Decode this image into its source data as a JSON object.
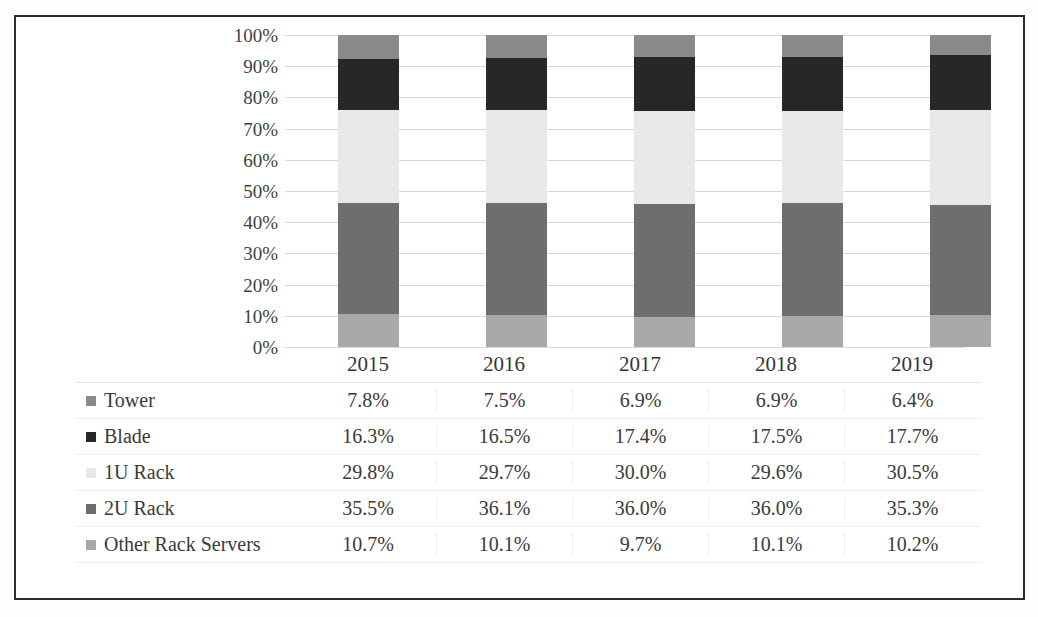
{
  "chart_data": {
    "type": "bar",
    "subtype": "100% stacked column with data table",
    "title": "",
    "subtitle": "",
    "xlabel": "",
    "ylabel": "",
    "ylim": [
      0,
      100
    ],
    "grid": true,
    "legend_position": "data-table-left",
    "categories": [
      "2015",
      "2016",
      "2017",
      "2018",
      "2019"
    ],
    "value_suffix": "%",
    "stack_order_bottom_to_top": [
      "Other Rack Servers",
      "2U Rack",
      "1U Rack",
      "Blade",
      "Tower"
    ],
    "series": [
      {
        "name": "Tower",
        "color": "#8a8a8a",
        "values": [
          7.8,
          7.5,
          6.9,
          6.9,
          6.4
        ],
        "labels": [
          "7.8%",
          "7.5%",
          "6.9%",
          "6.9%",
          "6.4%"
        ]
      },
      {
        "name": "Blade",
        "color": "#272727",
        "values": [
          16.3,
          16.5,
          17.4,
          17.5,
          17.7
        ],
        "labels": [
          "16.3%",
          "16.5%",
          "17.4%",
          "17.5%",
          "17.7%"
        ]
      },
      {
        "name": "1U Rack",
        "color": "#e8e8e8",
        "values": [
          29.8,
          29.7,
          30.0,
          29.6,
          30.5
        ],
        "labels": [
          "29.8%",
          "29.7%",
          "30.0%",
          "29.6%",
          "30.5%"
        ]
      },
      {
        "name": "2U Rack",
        "color": "#6e6e6e",
        "values": [
          35.5,
          36.1,
          36.0,
          36.0,
          35.3
        ],
        "labels": [
          "35.5%",
          "36.1%",
          "36.0%",
          "36.0%",
          "35.3%"
        ]
      },
      {
        "name": "Other Rack Servers",
        "color": "#a8a8a8",
        "values": [
          10.7,
          10.1,
          9.7,
          10.1,
          10.2
        ],
        "labels": [
          "10.7%",
          "10.1%",
          "9.7%",
          "10.1%",
          "10.2%"
        ]
      }
    ],
    "ytick_labels": [
      "100%",
      "90%",
      "80%",
      "70%",
      "60%",
      "50%",
      "40%",
      "30%",
      "20%",
      "10%",
      "0%"
    ]
  },
  "axis": {
    "ticks": [
      "100%",
      "90%",
      "80%",
      "70%",
      "60%",
      "50%",
      "40%",
      "30%",
      "20%",
      "10%",
      "0%"
    ]
  },
  "table": {
    "header": [
      "",
      "2015",
      "2016",
      "2017",
      "2018",
      "2019"
    ],
    "rows": [
      {
        "label": "Tower",
        "color": "#8a8a8a",
        "values": [
          "7.8%",
          "7.5%",
          "6.9%",
          "6.9%",
          "6.4%"
        ]
      },
      {
        "label": "Blade",
        "color": "#272727",
        "values": [
          "16.3%",
          "16.5%",
          "17.4%",
          "17.5%",
          "17.7%"
        ]
      },
      {
        "label": "1U Rack",
        "color": "#e8e8e8",
        "values": [
          "29.8%",
          "29.7%",
          "30.0%",
          "29.6%",
          "30.5%"
        ]
      },
      {
        "label": "2U Rack",
        "color": "#6e6e6e",
        "values": [
          "35.5%",
          "36.1%",
          "36.0%",
          "36.0%",
          "35.3%"
        ]
      },
      {
        "label": "Other Rack Servers",
        "color": "#a8a8a8",
        "values": [
          "10.7%",
          "10.1%",
          "9.7%",
          "10.1%",
          "10.2%"
        ]
      }
    ]
  }
}
